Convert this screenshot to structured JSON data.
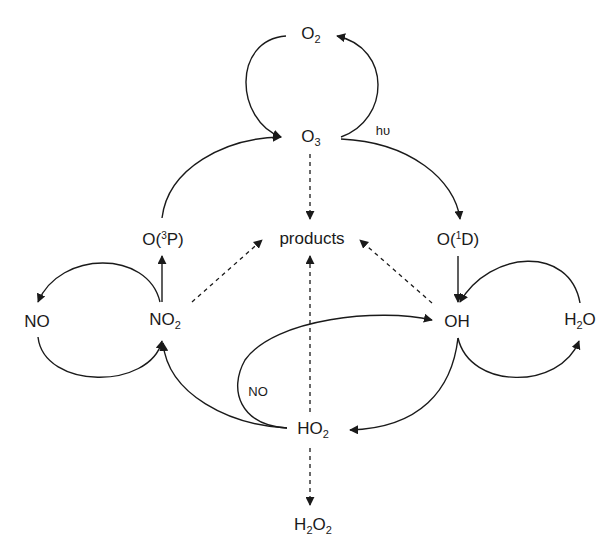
{
  "diagram": {
    "type": "reaction-cycle",
    "nodes": [
      {
        "id": "O2",
        "base": "O",
        "sub": "2",
        "sup": "",
        "tail": ""
      },
      {
        "id": "O3",
        "base": "O",
        "sub": "3",
        "sup": "",
        "tail": ""
      },
      {
        "id": "O3P",
        "base": "O(",
        "sub": "",
        "sup": "3",
        "tail": "P)"
      },
      {
        "id": "O1D",
        "base": "O(",
        "sub": "",
        "sup": "1",
        "tail": "D)"
      },
      {
        "id": "products",
        "base": "products",
        "sub": "",
        "sup": "",
        "tail": ""
      },
      {
        "id": "NO",
        "base": "NO",
        "sub": "",
        "sup": "",
        "tail": ""
      },
      {
        "id": "NO2",
        "base": "NO",
        "sub": "2",
        "sup": "",
        "tail": ""
      },
      {
        "id": "OH",
        "base": "OH",
        "sub": "",
        "sup": "",
        "tail": ""
      },
      {
        "id": "H2O",
        "base": "H",
        "sub": "2",
        "sup": "",
        "tail": "O"
      },
      {
        "id": "HO2",
        "base": "HO",
        "sub": "2",
        "sup": "",
        "tail": ""
      },
      {
        "id": "H2O2",
        "base": "H",
        "sub": "2",
        "sup": "",
        "tail": "O",
        "sub2": "2"
      }
    ],
    "edge_labels": {
      "hv": "hυ",
      "no": "NO"
    },
    "edges": [
      {
        "from": "O3",
        "to": "O2",
        "style": "solid"
      },
      {
        "from": "O2",
        "to": "O3",
        "style": "solid"
      },
      {
        "from": "O3",
        "to": "O1D",
        "style": "solid",
        "label": "hυ"
      },
      {
        "from": "O3P",
        "to": "O3",
        "style": "solid"
      },
      {
        "from": "O3",
        "to": "products",
        "style": "dashed"
      },
      {
        "from": "NO2",
        "to": "O3P",
        "style": "solid"
      },
      {
        "from": "NO2",
        "to": "NO",
        "style": "solid"
      },
      {
        "from": "NO",
        "to": "NO2",
        "style": "solid"
      },
      {
        "from": "NO2",
        "to": "products",
        "style": "dashed"
      },
      {
        "from": "O1D",
        "to": "OH",
        "style": "solid"
      },
      {
        "from": "H2O",
        "to": "OH",
        "style": "solid"
      },
      {
        "from": "OH",
        "to": "H2O",
        "style": "solid"
      },
      {
        "from": "OH",
        "to": "products",
        "style": "dashed"
      },
      {
        "from": "OH",
        "to": "HO2",
        "style": "solid"
      },
      {
        "from": "HO2",
        "to": "OH",
        "style": "solid",
        "label": "NO"
      },
      {
        "from": "HO2",
        "to": "NO2",
        "style": "solid"
      },
      {
        "from": "HO2",
        "to": "products",
        "style": "dashed"
      },
      {
        "from": "HO2",
        "to": "H2O2",
        "style": "dashed"
      }
    ]
  }
}
